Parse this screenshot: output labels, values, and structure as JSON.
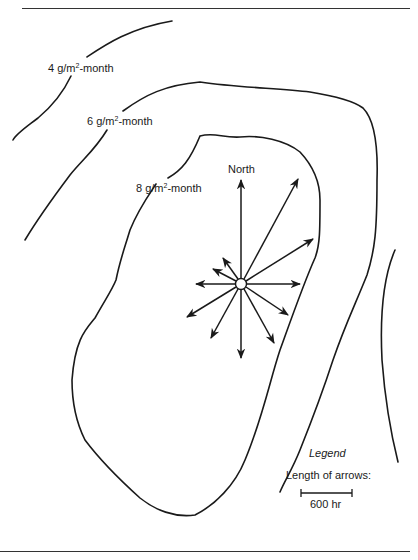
{
  "header_fragment": "…uppling p… …p",
  "contours": [
    {
      "id": "contour-4",
      "value": 4,
      "label_prefix": "4 g/m",
      "label_sup": "2",
      "label_suffix": "-month"
    },
    {
      "id": "contour-6",
      "value": 6,
      "label_prefix": "6 g/m",
      "label_sup": "2",
      "label_suffix": "-month"
    },
    {
      "id": "contour-8",
      "value": 8,
      "label_prefix": "8 g/m",
      "label_sup": "2",
      "label_suffix": "-month"
    }
  ],
  "wind_rose": {
    "north_label": "North",
    "center": [
      241,
      284
    ],
    "arrows": [
      {
        "direction": "N",
        "end": [
          241,
          178
        ]
      },
      {
        "direction": "NNE",
        "end": [
          299,
          177
        ]
      },
      {
        "direction": "ENE",
        "end": [
          315,
          238
        ]
      },
      {
        "direction": "E",
        "end": [
          302,
          284
        ]
      },
      {
        "direction": "SE",
        "end": [
          290,
          316
        ]
      },
      {
        "direction": "SSE",
        "end": [
          275,
          345
        ]
      },
      {
        "direction": "S",
        "end": [
          241,
          360
        ]
      },
      {
        "direction": "SSW",
        "end": [
          210,
          340
        ]
      },
      {
        "direction": "SW",
        "end": [
          185,
          318
        ]
      },
      {
        "direction": "W",
        "end": [
          194,
          284
        ]
      },
      {
        "direction": "WNW",
        "end": [
          211,
          269
        ]
      },
      {
        "direction": "NNW",
        "end": [
          222,
          257
        ]
      }
    ]
  },
  "legend": {
    "title": "Legend",
    "caption": "Length of arrows:",
    "scale_label": "600 hr"
  }
}
